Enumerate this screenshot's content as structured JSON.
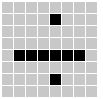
{
  "app": {
    "title": "Pixel Grid",
    "widget_name": "pixel-grid"
  },
  "grid": {
    "columns": 8,
    "rows": 8,
    "cell_size_px": 11,
    "cell_pitch_px": 12,
    "origin_x_px": 2,
    "origin_y_px": 2,
    "background_color": "#ffffff",
    "off_color": "#c8c8c8",
    "on_color": "#000000",
    "on_label": "on",
    "off_label": "off"
  },
  "chart_data": {
    "type": "heatmap",
    "xlabel": "",
    "ylabel": "",
    "grid": true,
    "legend": "none",
    "categories_x": [
      "1",
      "2",
      "3",
      "4",
      "5",
      "6",
      "7",
      "8"
    ],
    "categories_y": [
      "1",
      "2",
      "3",
      "4",
      "5",
      "6",
      "7",
      "8"
    ],
    "values": [
      [
        0,
        0,
        0,
        0,
        0,
        0,
        0,
        0
      ],
      [
        0,
        0,
        0,
        0,
        1,
        0,
        0,
        0
      ],
      [
        0,
        0,
        0,
        0,
        0,
        0,
        0,
        0
      ],
      [
        0,
        0,
        0,
        0,
        0,
        0,
        0,
        0
      ],
      [
        0,
        1,
        1,
        1,
        1,
        1,
        1,
        0
      ],
      [
        0,
        0,
        0,
        0,
        0,
        0,
        0,
        0
      ],
      [
        0,
        0,
        0,
        0,
        1,
        0,
        0,
        0
      ],
      [
        0,
        0,
        0,
        0,
        0,
        0,
        0,
        0
      ]
    ]
  }
}
